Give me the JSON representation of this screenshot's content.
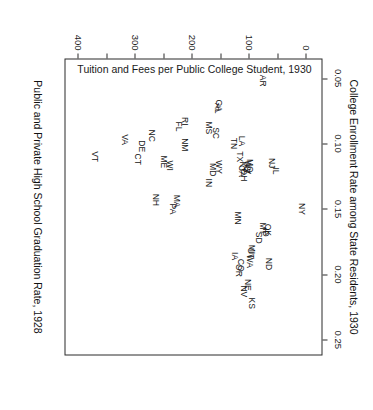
{
  "chart_data": {
    "type": "scatter",
    "title": "College Enrollment Rate among State Residents, 1930",
    "xlabel": "Public and Private High School Graduation Rate, 1928",
    "ylabel": "Tuition and Fees per Public College Student, 1930",
    "xlim": [
      0.035,
      0.262
    ],
    "ylim": [
      -28,
      425
    ],
    "xticks": [
      0.05,
      0.1,
      0.15,
      0.2,
      0.25
    ],
    "xtick_labels": [
      "0.05",
      "0.10",
      "0.15",
      "0.20",
      "0.25"
    ],
    "yticks": [
      0,
      50,
      100,
      150,
      200,
      250,
      300,
      350,
      400
    ],
    "ytick_labels": [
      "0",
      "",
      "100",
      "",
      "200",
      "",
      "300",
      "",
      "400"
    ],
    "grid": false,
    "legend": null,
    "point_marker": "text-label",
    "points": [
      {
        "label": "NY",
        "x": 0.15,
        "y": 9
      },
      {
        "label": "AR",
        "x": 0.052,
        "y": 78
      },
      {
        "label": "IL",
        "x": 0.121,
        "y": 54
      },
      {
        "label": "NJ",
        "x": 0.115,
        "y": 62
      },
      {
        "label": "ND",
        "x": 0.192,
        "y": 66
      },
      {
        "label": "OK",
        "x": 0.166,
        "y": 68
      },
      {
        "label": "ID",
        "x": 0.168,
        "y": 72
      },
      {
        "label": "MT",
        "x": 0.165,
        "y": 77
      },
      {
        "label": "SD",
        "x": 0.172,
        "y": 84
      },
      {
        "label": "MI",
        "x": 0.181,
        "y": 96
      },
      {
        "label": "UT",
        "x": 0.184,
        "y": 99
      },
      {
        "label": "WA",
        "x": 0.19,
        "y": 101
      },
      {
        "label": "KS",
        "x": 0.222,
        "y": 96
      },
      {
        "label": "NE",
        "x": 0.208,
        "y": 104
      },
      {
        "label": "NV",
        "x": 0.213,
        "y": 110
      },
      {
        "label": "MO",
        "x": 0.117,
        "y": 100
      },
      {
        "label": "WV",
        "x": 0.118,
        "y": 103
      },
      {
        "label": "AZ",
        "x": 0.119,
        "y": 106
      },
      {
        "label": "KY",
        "x": 0.118,
        "y": 113
      },
      {
        "label": "OH",
        "x": 0.124,
        "y": 110
      },
      {
        "label": "CA",
        "x": 0.121,
        "y": 115
      },
      {
        "label": "LA",
        "x": 0.098,
        "y": 114
      },
      {
        "label": "TX",
        "x": 0.11,
        "y": 118
      },
      {
        "label": "CO",
        "x": 0.193,
        "y": 116
      },
      {
        "label": "OR",
        "x": 0.197,
        "y": 119
      },
      {
        "label": "MN",
        "x": 0.157,
        "y": 122
      },
      {
        "label": "IA",
        "x": 0.186,
        "y": 127
      },
      {
        "label": "TN",
        "x": 0.1,
        "y": 128
      },
      {
        "label": "GA",
        "x": 0.071,
        "y": 155
      },
      {
        "label": "AL",
        "x": 0.073,
        "y": 157
      },
      {
        "label": "SC",
        "x": 0.092,
        "y": 160
      },
      {
        "label": "WY",
        "x": 0.118,
        "y": 155
      },
      {
        "label": "MD",
        "x": 0.12,
        "y": 166
      },
      {
        "label": "IN",
        "x": 0.13,
        "y": 173
      },
      {
        "label": "MS",
        "x": 0.088,
        "y": 173
      },
      {
        "label": "RI",
        "x": 0.083,
        "y": 215
      },
      {
        "label": "FL",
        "x": 0.087,
        "y": 224
      },
      {
        "label": "NM",
        "x": 0.101,
        "y": 215
      },
      {
        "label": "MA",
        "x": 0.144,
        "y": 228
      },
      {
        "label": "PA",
        "x": 0.15,
        "y": 236
      },
      {
        "label": "WI",
        "x": 0.117,
        "y": 240
      },
      {
        "label": "ME",
        "x": 0.114,
        "y": 252
      },
      {
        "label": "NH",
        "x": 0.143,
        "y": 265
      },
      {
        "label": "NC",
        "x": 0.094,
        "y": 272
      },
      {
        "label": "DE",
        "x": 0.102,
        "y": 289
      },
      {
        "label": "CT",
        "x": 0.112,
        "y": 297
      },
      {
        "label": "VA",
        "x": 0.097,
        "y": 320
      },
      {
        "label": "VT",
        "x": 0.11,
        "y": 372
      }
    ]
  }
}
